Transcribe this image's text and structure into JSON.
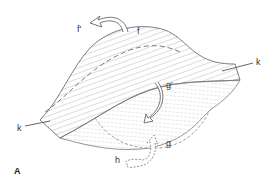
{
  "figure": {
    "panel_label": "A",
    "labels": {
      "f_prime": "f'",
      "f": "f",
      "g_prime": "g'",
      "g": "g",
      "h": "h",
      "k_left": "k",
      "k_right": "k"
    },
    "colors": {
      "stroke": "#6e6e6e",
      "hatch": "#9a9a9a",
      "text": "#333333",
      "background": "#ffffff"
    }
  }
}
